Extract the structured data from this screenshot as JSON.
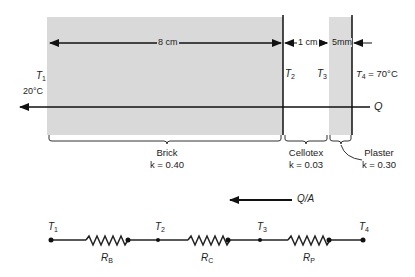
{
  "diagram": {
    "layers": [
      {
        "name": "Brick",
        "k_label": "k = 0.40",
        "k": 0.4,
        "thickness": "8 cm",
        "fill": "#d9d9d9"
      },
      {
        "name": "Cellotex",
        "k_label": "k = 0.03",
        "k": 0.03,
        "thickness": "1 cm",
        "fill": "#ffffff"
      },
      {
        "name": "Plaster",
        "k_label": "k = 0.30",
        "k": 0.3,
        "thickness": "5mm",
        "fill": "#dcdcdc"
      }
    ],
    "temperatures": {
      "t1": {
        "symbol": "T",
        "sub": "1",
        "value": "20°C"
      },
      "t2": {
        "symbol": "T",
        "sub": "2"
      },
      "t3": {
        "symbol": "T",
        "sub": "3"
      },
      "t4": {
        "symbol": "T",
        "sub": "4",
        "value": "= 70°C"
      }
    },
    "heat_flow": {
      "label": "Q",
      "direction": "right-to-left"
    },
    "network": {
      "flux_label": "Q/A",
      "nodes": [
        {
          "symbol": "T",
          "sub": "1"
        },
        {
          "symbol": "T",
          "sub": "2"
        },
        {
          "symbol": "T",
          "sub": "3"
        },
        {
          "symbol": "T",
          "sub": "4"
        }
      ],
      "resistors": [
        {
          "symbol": "R",
          "sub": "B"
        },
        {
          "symbol": "R",
          "sub": "C"
        },
        {
          "symbol": "R",
          "sub": "P"
        }
      ]
    }
  }
}
